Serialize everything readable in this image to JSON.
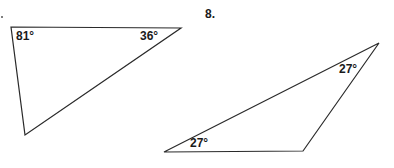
{
  "problems": [
    {
      "number": "7.",
      "number_visible": false,
      "triangle": {
        "vertices": [
          [
            11,
            27
          ],
          [
            181,
            28
          ],
          [
            25,
            135
          ]
        ],
        "angles": [
          {
            "label": "81°",
            "vertex": "top-left"
          },
          {
            "label": "36°",
            "vertex": "top-right"
          }
        ]
      }
    },
    {
      "number": "8.",
      "number_visible": true,
      "triangle": {
        "vertices": [
          [
            164,
            152
          ],
          [
            303,
            151
          ],
          [
            379,
            43
          ]
        ],
        "angles": [
          {
            "label": "27°",
            "vertex": "top-right"
          },
          {
            "label": "27°",
            "vertex": "bottom-left"
          }
        ]
      }
    }
  ],
  "colors": {
    "line": "#2a2a2a",
    "text": "#1a1a1a",
    "background": "#ffffff"
  }
}
